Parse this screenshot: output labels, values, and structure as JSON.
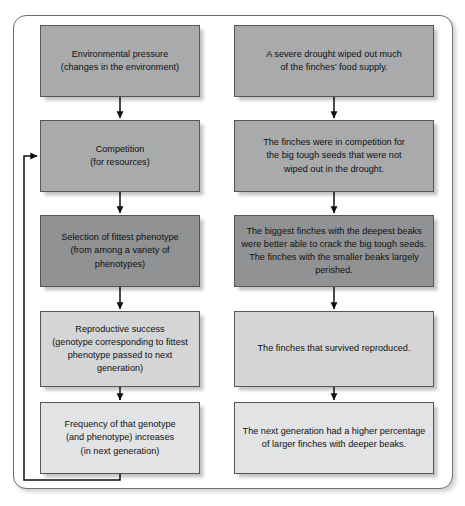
{
  "figure": {
    "title_visible": false,
    "frame": {
      "stroke": "#6e6e6e"
    },
    "columns": [
      {
        "name": "general-process",
        "x": 40,
        "width": 160
      },
      {
        "name": "finch-example",
        "x": 234,
        "width": 200
      }
    ],
    "rows": [
      {
        "index": 1,
        "y": 25,
        "height": 72,
        "fill": "#a9aaab"
      },
      {
        "index": 2,
        "y": 120,
        "height": 72,
        "fill": "#a9aaab"
      },
      {
        "index": 3,
        "y": 215,
        "height": 72,
        "fill": "#919294"
      },
      {
        "index": 4,
        "y": 311,
        "height": 76,
        "fill": "#d4d5d6"
      },
      {
        "index": 5,
        "y": 402,
        "height": 72,
        "fill": "#e2e3e4"
      }
    ],
    "nodes": [
      {
        "id": "environmental-pressure",
        "column": 0,
        "row": 1,
        "text": "Environmental pressure\n(changes in the environment)"
      },
      {
        "id": "severe-drought",
        "column": 1,
        "row": 1,
        "text": "A severe drought wiped out much\nof the finches’ food supply."
      },
      {
        "id": "competition",
        "column": 0,
        "row": 2,
        "text": "Competition\n(for resources)"
      },
      {
        "id": "finches-competition",
        "column": 1,
        "row": 2,
        "text": "The finches were in competition for\nthe big tough seeds that were not\nwiped out in the drought."
      },
      {
        "id": "selection-fittest-phenotype",
        "column": 0,
        "row": 3,
        "text": "Selection of fittest phenotype\n(from among a variety of phenotypes)"
      },
      {
        "id": "biggest-finches-deepest-beaks",
        "column": 1,
        "row": 3,
        "text": "The biggest finches with the deepest beaks\nwere better able to crack the big tough seeds.\nThe finches with the smaller beaks largely perished."
      },
      {
        "id": "reproductive-success",
        "column": 0,
        "row": 4,
        "text": "Reproductive success\n(genotype corresponding to fittest\nphenotype passed to next generation)"
      },
      {
        "id": "finches-survived-reproduced",
        "column": 1,
        "row": 4,
        "text": "The finches that survived reproduced."
      },
      {
        "id": "frequency-genotype-increases",
        "column": 0,
        "row": 5,
        "text": "Frequency of that genotype\n(and phenotype) increases\n(in next generation)"
      },
      {
        "id": "next-generation-higher-percentage",
        "column": 1,
        "row": 5,
        "text": "The next generation had a higher percentage\nof larger finches with deeper beaks."
      }
    ],
    "connectors": [
      {
        "id": "arrow-left-1-2",
        "type": "down-arrow",
        "from": "environmental-pressure",
        "to": "competition"
      },
      {
        "id": "arrow-left-2-3",
        "type": "down-arrow",
        "from": "competition",
        "to": "selection-fittest-phenotype"
      },
      {
        "id": "arrow-left-3-4",
        "type": "down-arrow",
        "from": "selection-fittest-phenotype",
        "to": "reproductive-success"
      },
      {
        "id": "arrow-left-4-5",
        "type": "down-arrow",
        "from": "reproductive-success",
        "to": "frequency-genotype-increases"
      },
      {
        "id": "arrow-right-1-2",
        "type": "down-arrow",
        "from": "severe-drought",
        "to": "finches-competition"
      },
      {
        "id": "arrow-right-2-3",
        "type": "down-arrow",
        "from": "finches-competition",
        "to": "biggest-finches-deepest-beaks"
      },
      {
        "id": "arrow-right-3-4",
        "type": "down-arrow",
        "from": "biggest-finches-deepest-beaks",
        "to": "finches-survived-reproduced"
      },
      {
        "id": "arrow-right-4-5",
        "type": "down-arrow",
        "from": "finches-survived-reproduced",
        "to": "next-generation-higher-percentage"
      },
      {
        "id": "feedback-loop",
        "type": "loop-arrow",
        "from": "frequency-genotype-increases",
        "to": "competition"
      }
    ]
  }
}
